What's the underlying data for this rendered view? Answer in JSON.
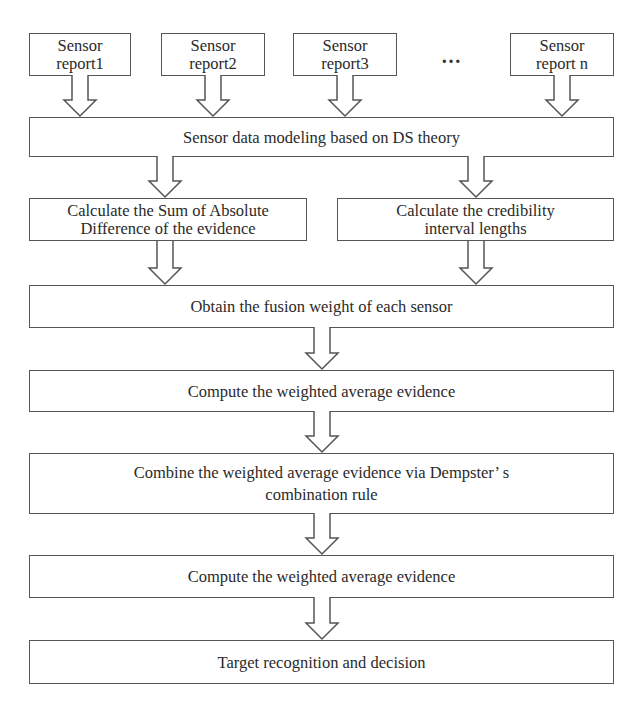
{
  "diagram": {
    "type": "flowchart",
    "sensors": [
      {
        "line1": "Sensor",
        "line2": "report1"
      },
      {
        "line1": "Sensor",
        "line2": "report2"
      },
      {
        "line1": "Sensor",
        "line2": "report3"
      },
      {
        "line1": "Sensor",
        "line2": "report n"
      }
    ],
    "ellipsis": "…",
    "steps": {
      "modeling": "Sensor data modeling based on DS theory",
      "sad": {
        "line1": "Calculate the Sum of Absolute",
        "line2": "Difference of  the evidence"
      },
      "credibility": {
        "line1": "Calculate the credibility",
        "line2": "interval lengths"
      },
      "fusion_weight": "Obtain the fusion weight of each sensor",
      "weighted_avg_1": "Compute the weighted average evidence",
      "combine": {
        "line1": "Combine the weighted average evidence via Dempster’ s",
        "line2": "combination rule"
      },
      "weighted_avg_2": "Compute the weighted average evidence",
      "decision": "Target recognition and decision"
    },
    "colors": {
      "border": "#555555",
      "text": "#2a2a2a",
      "background": "#ffffff"
    }
  }
}
